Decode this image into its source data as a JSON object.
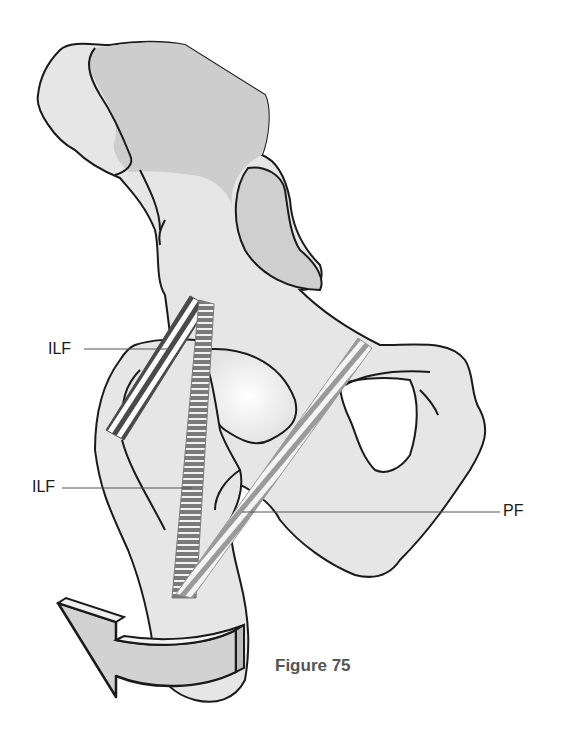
{
  "figure": {
    "caption": "Figure 75"
  },
  "labels": [
    {
      "id": "ilf-upper",
      "text": "ILF"
    },
    {
      "id": "ilf-lower",
      "text": "ILF"
    },
    {
      "id": "pf",
      "text": "PF"
    }
  ],
  "colors": {
    "bone_fill": "#e8e8e8",
    "bone_dark": "#c8c8c8",
    "outline": "#1a1a1a",
    "ligament_dark": "#555555",
    "ligament_mid": "#7a7a7a",
    "ligament_light": "#9a9a9a",
    "arrow_fill": "#d0d0d0",
    "caption": "#555555"
  },
  "arrow": {
    "direction": "rotation",
    "icon": "curved-arrow-icon"
  }
}
